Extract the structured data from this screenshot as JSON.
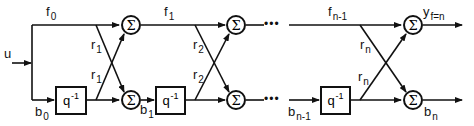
{
  "diagram": {
    "type": "lattice-filter",
    "input": {
      "label": "u"
    },
    "signals": {
      "f0": {
        "base": "f",
        "sub": "0"
      },
      "f1": {
        "base": "f",
        "sub": "1"
      },
      "fn1": {
        "base": "f",
        "sub": "n-1"
      },
      "b0": {
        "base": "b",
        "sub": "0"
      },
      "b1": {
        "base": "b",
        "sub": "1"
      },
      "bn1": {
        "base": "b",
        "sub": "n-1"
      },
      "bn": {
        "base": "b",
        "sub": "n"
      },
      "y": {
        "base": "y",
        "sub": "f=n"
      }
    },
    "delay": {
      "base": "q",
      "sup": "-1"
    },
    "sum_symbol": "Σ",
    "stages": [
      {
        "coef": {
          "base": "r",
          "sub": "1"
        }
      },
      {
        "coef": {
          "base": "r",
          "sub": "2"
        }
      },
      {
        "coef": {
          "base": "r",
          "sub": "n"
        }
      }
    ],
    "ellipsis": "•••"
  }
}
